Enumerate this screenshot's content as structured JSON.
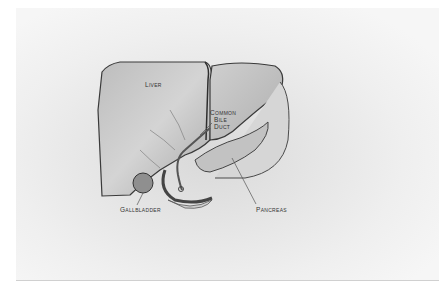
{
  "figure": {
    "type": "anatomical-illustration",
    "style": "pencil drawing",
    "colors": {
      "paper": "#f2f2f2",
      "shading": "#9a9a9a",
      "outline": "#3a3a3a"
    }
  },
  "labels": {
    "liver": "Liver",
    "common_bile_duct_1": "Common",
    "common_bile_duct_2": "Bile",
    "common_bile_duct_3": "Duct",
    "gallbladder": "Gallbladder",
    "pancreas": "Pancreas"
  }
}
